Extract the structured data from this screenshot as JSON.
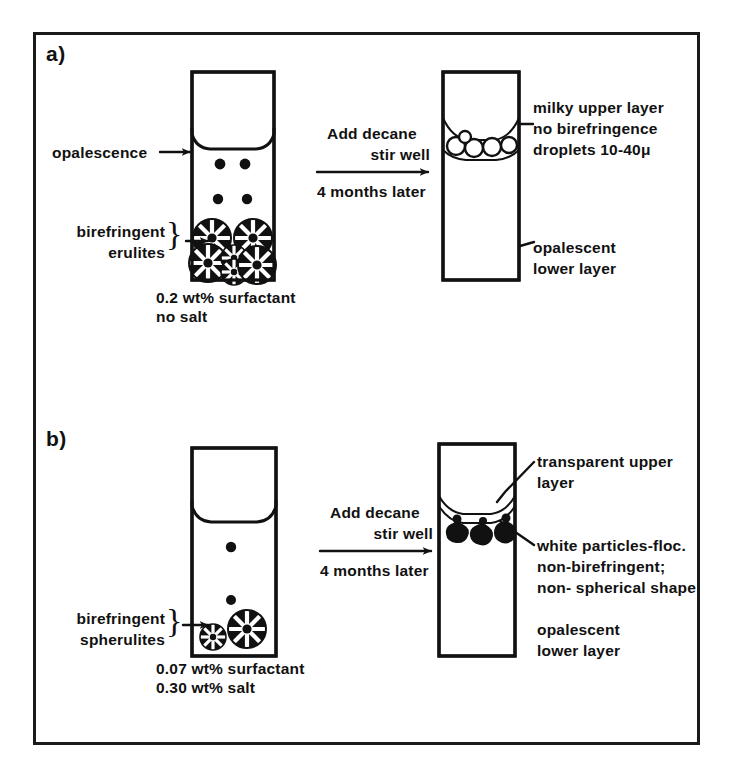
{
  "figure": {
    "ink_color": "#111111",
    "background": "#ffffff"
  },
  "panels": [
    {
      "id": "a",
      "label": "a)",
      "left_tube": {
        "caption_line1": "0.2 wt% surfactant",
        "caption_line2": "no salt",
        "annotations": [
          {
            "name": "opalescence",
            "text": "opalescence",
            "marker": "arrow",
            "brace": false
          },
          {
            "name": "birefringent-erulites",
            "text_line1": "birefringent",
            "text_line2": "erulites",
            "marker": "arrow",
            "brace": true
          }
        ],
        "contents": {
          "opalescence_dots": 4,
          "spherulites": 6,
          "spherulite_style": "filled-dark-with-white-spokes"
        }
      },
      "transition": {
        "line1": "Add decane",
        "line2": "stir well",
        "line3": "4 months later",
        "arrow": "right-arrow"
      },
      "right_tube": {
        "annotations": [
          {
            "name": "milky-upper-layer",
            "line1": "milky upper layer",
            "line2": "no birefringence",
            "line3": "droplets 10-40μ"
          },
          {
            "name": "opalescent-lower-layer",
            "line1": "opalescent",
            "line2": "lower layer"
          }
        ],
        "contents": {
          "droplets": 5,
          "droplet_style": "open-circles"
        }
      }
    },
    {
      "id": "b",
      "label": "b)",
      "left_tube": {
        "caption_line1": "0.07 wt% surfactant",
        "caption_line2": "0.30 wt% salt",
        "annotations": [
          {
            "name": "birefringent-spherulites",
            "text_line1": "birefringent",
            "text_line2": "spherulites",
            "marker": "arrow",
            "brace": true
          }
        ],
        "contents": {
          "opalescence_dots": 2,
          "spherulites": 2,
          "spherulite_style": "filled-dark-with-white-spokes"
        }
      },
      "transition": {
        "line1": "Add decane",
        "line2": "stir well",
        "line3": "4 months later",
        "arrow": "right-arrow"
      },
      "right_tube": {
        "annotations": [
          {
            "name": "transparent-upper-layer",
            "line1": "transparent upper",
            "line2": "layer"
          },
          {
            "name": "white-particles-floc",
            "line1": "white particles-floc.",
            "line2": "non-birefringent;",
            "line3": "non- spherical shape"
          },
          {
            "name": "opalescent-lower-layer",
            "line1": "opalescent",
            "line2": "lower layer"
          }
        ],
        "contents": {
          "particles": 3,
          "particle_style": "irregular-dark-blobs"
        }
      }
    }
  ]
}
